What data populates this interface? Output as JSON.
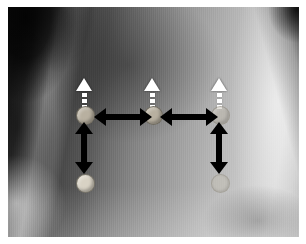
{
  "figure": {
    "kind": "annotated-photograph",
    "canvas": {
      "width": 306,
      "height": 244,
      "background": "#ffffff"
    },
    "plate": {
      "left": 8,
      "top": 7,
      "width": 291,
      "height": 230
    }
  },
  "palette": {
    "annotation_black": "#000000",
    "marker_white": "#ffffff",
    "disc_tan": "#a9a08f",
    "disc_bright": "#d8d2c4",
    "plate_midtone": "#8d8d8d"
  },
  "markers": [
    {
      "id": "marker-left",
      "label": "left landmark",
      "x": 84,
      "triangle_y": 78,
      "dash_count": 4,
      "disc_y": 107,
      "disc_style": "solid"
    },
    {
      "id": "marker-center",
      "label": "center landmark",
      "x": 152,
      "triangle_y": 78,
      "dash_count": 4,
      "disc_y": 107,
      "disc_style": "solid"
    },
    {
      "id": "marker-right",
      "label": "right landmark",
      "x": 219,
      "triangle_y": 78,
      "dash_count": 4,
      "disc_y": 107,
      "disc_style": "faint"
    }
  ],
  "lower_discs": [
    {
      "id": "disc-lower-left",
      "label": "left lower landmark",
      "x": 84,
      "y": 175,
      "disc_style": "bright"
    },
    {
      "id": "disc-lower-right",
      "label": "right lower landmark",
      "x": 219,
      "y": 175,
      "disc_style": "faint2"
    }
  ],
  "arrows": [
    {
      "id": "arrow-horizontal-left",
      "label": "horizontal span left-to-center",
      "orientation": "horizontal",
      "double_headed": true,
      "left": 94,
      "top": 108,
      "length": 58
    },
    {
      "id": "arrow-horizontal-right",
      "label": "horizontal span center-to-right",
      "orientation": "horizontal",
      "double_headed": true,
      "left": 160,
      "top": 108,
      "length": 58
    },
    {
      "id": "arrow-vertical-left",
      "label": "vertical span left marker to left lower disc",
      "orientation": "vertical",
      "double_headed": true,
      "left": 76,
      "top": 122,
      "length": 52
    },
    {
      "id": "arrow-vertical-right",
      "label": "vertical span right marker to right lower disc",
      "orientation": "vertical",
      "double_headed": true,
      "left": 211,
      "top": 122,
      "length": 52
    }
  ]
}
